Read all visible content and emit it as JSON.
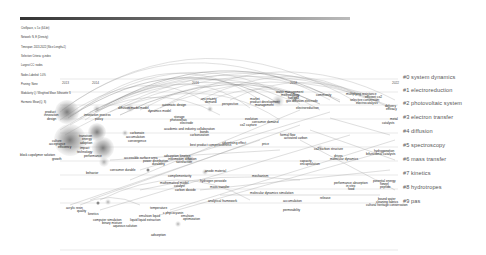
{
  "header": {
    "lines": [
      "CiteSpace, v. 5.x (64-bit)",
      "Network: N, E (Density)",
      "Timespan: 2013-2022 (Slice Length=1)",
      "Selection Criteria: g-index",
      "Largest CC: nodes",
      "Nodes Labeled: 1.0%",
      "Pruning: None",
      "Modularity Q / Weighted Mean Silhouette S",
      "Harmonic Mean(Q, S)"
    ]
  },
  "timeline": {
    "years": [
      {
        "label": "2013",
        "x": 65
      },
      {
        "label": "2014",
        "x": 95
      },
      {
        "label": "2016",
        "x": 195
      },
      {
        "label": "2018",
        "x": 293
      },
      {
        "label": "2022",
        "x": 395
      }
    ]
  },
  "clusters": [
    {
      "id": "#0",
      "label": "#0 system dynamics",
      "y": 77
    },
    {
      "id": "#1",
      "label": "#1 electroreduction",
      "y": 90
    },
    {
      "id": "#2",
      "label": "#2 photovoltaic system",
      "y": 103
    },
    {
      "id": "#3",
      "label": "#3 electron transfer",
      "y": 117
    },
    {
      "id": "#4",
      "label": "#4 diffusion",
      "y": 131
    },
    {
      "id": "#5",
      "label": "#5 spectroscopy",
      "y": 145
    },
    {
      "id": "#6",
      "label": "#6 mass transfer",
      "y": 159
    },
    {
      "id": "#7",
      "label": "#7 kinetics",
      "y": 173
    },
    {
      "id": "#8",
      "label": "#8 hydrotropes",
      "y": 187
    },
    {
      "id": "#9",
      "label": "#9 pas",
      "y": 201
    }
  ],
  "keywords": [
    {
      "t": "product",
      "x": 45,
      "y": 111
    },
    {
      "t": "innovation",
      "x": 44,
      "y": 114
    },
    {
      "t": "design",
      "x": 47,
      "y": 118
    },
    {
      "t": "diffusion model",
      "x": 118,
      "y": 107
    },
    {
      "t": "innovation process",
      "x": 84,
      "y": 114
    },
    {
      "t": "policy",
      "x": 95,
      "y": 118
    },
    {
      "t": "model",
      "x": 140,
      "y": 107
    },
    {
      "t": "dynamics model",
      "x": 148,
      "y": 110
    },
    {
      "t": "automatic design",
      "x": 162,
      "y": 104
    },
    {
      "t": "uncertainty",
      "x": 201,
      "y": 98
    },
    {
      "t": "demand",
      "x": 205,
      "y": 101
    },
    {
      "t": "perspective",
      "x": 222,
      "y": 103
    },
    {
      "t": "market",
      "x": 250,
      "y": 98
    },
    {
      "t": "product development",
      "x": 250,
      "y": 101
    },
    {
      "t": "management",
      "x": 255,
      "y": 104
    },
    {
      "t": "water management",
      "x": 276,
      "y": 91
    },
    {
      "t": "methodology",
      "x": 281,
      "y": 94
    },
    {
      "t": "fuel cell",
      "x": 288,
      "y": 97
    },
    {
      "t": "gas diffusion electrode",
      "x": 286,
      "y": 100
    },
    {
      "t": "electroreduction",
      "x": 296,
      "y": 107
    },
    {
      "t": "community",
      "x": 316,
      "y": 94
    },
    {
      "t": "multiplying resistance",
      "x": 346,
      "y": 93
    },
    {
      "t": "efficient co2",
      "x": 365,
      "y": 96
    },
    {
      "t": "selective conversion",
      "x": 350,
      "y": 99
    },
    {
      "t": "electrocatalysis",
      "x": 356,
      "y": 102
    },
    {
      "t": "delivery",
      "x": 385,
      "y": 105
    },
    {
      "t": "efficacy",
      "x": 386,
      "y": 108
    },
    {
      "t": "metal",
      "x": 390,
      "y": 118
    },
    {
      "t": "catalysts",
      "x": 382,
      "y": 122
    },
    {
      "t": "culture",
      "x": 52,
      "y": 140
    },
    {
      "t": "acceptance",
      "x": 49,
      "y": 143
    },
    {
      "t": "efficiency",
      "x": 58,
      "y": 146
    },
    {
      "t": "transition",
      "x": 79,
      "y": 135
    },
    {
      "t": "energy",
      "x": 82,
      "y": 138
    },
    {
      "t": "adoption",
      "x": 80,
      "y": 142
    },
    {
      "t": "block copolymer solution",
      "x": 20,
      "y": 154
    },
    {
      "t": "growth",
      "x": 52,
      "y": 158
    },
    {
      "t": "impact",
      "x": 80,
      "y": 147
    },
    {
      "t": "technology",
      "x": 77,
      "y": 151
    },
    {
      "t": "performance",
      "x": 84,
      "y": 155
    },
    {
      "t": "behavior",
      "x": 86,
      "y": 172
    },
    {
      "t": "carbonate",
      "x": 130,
      "y": 132
    },
    {
      "t": "accumulation",
      "x": 126,
      "y": 136
    },
    {
      "t": "convergence",
      "x": 128,
      "y": 140
    },
    {
      "t": "storage",
      "x": 174,
      "y": 116
    },
    {
      "t": "photovoltaic",
      "x": 170,
      "y": 119
    },
    {
      "t": "electrode",
      "x": 180,
      "y": 122
    },
    {
      "t": "academic and industry collaboration",
      "x": 164,
      "y": 128
    },
    {
      "t": "bonds",
      "x": 200,
      "y": 131
    },
    {
      "t": "carbonization",
      "x": 190,
      "y": 134
    },
    {
      "t": "evolution",
      "x": 245,
      "y": 118
    },
    {
      "t": "consumer demand",
      "x": 252,
      "y": 121
    },
    {
      "t": "co2 capture",
      "x": 240,
      "y": 124
    },
    {
      "t": "accessible surface area",
      "x": 124,
      "y": 157
    },
    {
      "t": "power distribution",
      "x": 143,
      "y": 160
    },
    {
      "t": "durability",
      "x": 152,
      "y": 163
    },
    {
      "t": "consumer durable",
      "x": 110,
      "y": 169
    },
    {
      "t": "adsorption kinetics",
      "x": 164,
      "y": 155
    },
    {
      "t": "information diffusion",
      "x": 168,
      "y": 158
    },
    {
      "t": "satisfaction",
      "x": 176,
      "y": 161
    },
    {
      "t": "advertising effect",
      "x": 222,
      "y": 142
    },
    {
      "t": "best product competitiveness",
      "x": 190,
      "y": 144
    },
    {
      "t": "price",
      "x": 262,
      "y": 143
    },
    {
      "t": "complementarity",
      "x": 168,
      "y": 175
    },
    {
      "t": "mathematical model",
      "x": 160,
      "y": 182
    },
    {
      "t": "catalyst",
      "x": 174,
      "y": 185
    },
    {
      "t": "carbon dioxide",
      "x": 175,
      "y": 189
    },
    {
      "t": "anode material",
      "x": 205,
      "y": 170
    },
    {
      "t": "hydrogen peroxide",
      "x": 200,
      "y": 180
    },
    {
      "t": "mass transfer",
      "x": 210,
      "y": 186
    },
    {
      "t": "mechanism",
      "x": 252,
      "y": 175
    },
    {
      "t": "formal flow",
      "x": 280,
      "y": 134
    },
    {
      "t": "activated carbon",
      "x": 284,
      "y": 137
    },
    {
      "t": "capacity",
      "x": 300,
      "y": 160
    },
    {
      "t": "encapsulation",
      "x": 300,
      "y": 163
    },
    {
      "t": "molecular dynamics simulation",
      "x": 250,
      "y": 192
    },
    {
      "t": "accumulation",
      "x": 283,
      "y": 200
    },
    {
      "t": "release",
      "x": 320,
      "y": 197
    },
    {
      "t": "permeability",
      "x": 283,
      "y": 209
    },
    {
      "t": "analytical framework",
      "x": 208,
      "y": 200
    },
    {
      "t": "co2 carbon structure",
      "x": 314,
      "y": 148
    },
    {
      "t": "drives",
      "x": 334,
      "y": 155
    },
    {
      "t": "molecular dynamics",
      "x": 330,
      "y": 158
    },
    {
      "t": "hydrogenation",
      "x": 374,
      "y": 150
    },
    {
      "t": "bifunctional catalysts",
      "x": 366,
      "y": 153
    },
    {
      "t": "performance absorption",
      "x": 334,
      "y": 182
    },
    {
      "t": "in vitro",
      "x": 346,
      "y": 185
    },
    {
      "t": "food",
      "x": 348,
      "y": 188
    },
    {
      "t": "potential energy",
      "x": 373,
      "y": 180
    },
    {
      "t": "funnel",
      "x": 380,
      "y": 183
    },
    {
      "t": "peptide",
      "x": 380,
      "y": 186
    },
    {
      "t": "bound water",
      "x": 378,
      "y": 198
    },
    {
      "t": "cleaning fabrics",
      "x": 376,
      "y": 201
    },
    {
      "t": "cultural heritage conservation",
      "x": 366,
      "y": 204
    },
    {
      "t": "acrylic resin",
      "x": 66,
      "y": 207
    },
    {
      "t": "quality",
      "x": 77,
      "y": 210
    },
    {
      "t": "kinetics",
      "x": 88,
      "y": 213
    },
    {
      "t": "temperature",
      "x": 150,
      "y": 207
    },
    {
      "t": "c phycocyanin",
      "x": 163,
      "y": 212
    },
    {
      "t": "emulsion",
      "x": 181,
      "y": 215
    },
    {
      "t": "optimization",
      "x": 183,
      "y": 218
    },
    {
      "t": "emulsion liquid",
      "x": 139,
      "y": 215
    },
    {
      "t": "computer simulation",
      "x": 93,
      "y": 219
    },
    {
      "t": "liquid liquid extraction",
      "x": 130,
      "y": 219
    },
    {
      "t": "binary mixture",
      "x": 102,
      "y": 222
    },
    {
      "t": "aqueous solution",
      "x": 113,
      "y": 225
    },
    {
      "t": "adsorption",
      "x": 151,
      "y": 234
    }
  ]
}
